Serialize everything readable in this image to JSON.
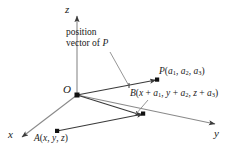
{
  "figure": {
    "type": "3d-coordinate-vector-diagram",
    "background_color": "#ffffff",
    "line_color": "#3a3a3a",
    "text_color": "#1a1a1a"
  },
  "axes": {
    "x_label": "x",
    "y_label": "y",
    "z_label": "z"
  },
  "origin": {
    "label": "O"
  },
  "annotation": {
    "line1": "position",
    "line2_prefix": "vector of ",
    "line2_italic": "P"
  },
  "points": {
    "P": {
      "name": "P",
      "coord_open": "(",
      "c1": "a",
      "c1_sub": "1",
      "sep1": ", ",
      "c2": "a",
      "c2_sub": "2",
      "sep2": ", ",
      "c3": "a",
      "c3_sub": "3",
      "coord_close": ")"
    },
    "B": {
      "name": "B",
      "coord_open": "(",
      "t1a": "x",
      "t1op": " + ",
      "t1b": "a",
      "t1b_sub": "1",
      "sep1": ", ",
      "t2a": "y",
      "t2op": " + ",
      "t2b": "a",
      "t2b_sub": "2",
      "sep2": ", ",
      "t3a": "z",
      "t3op": " + ",
      "t3b": "a",
      "t3b_sub": "3",
      "coord_close": ")"
    },
    "A": {
      "name": "A",
      "coord_open": "(",
      "c1": "x",
      "sep1": ", ",
      "c2": "y",
      "sep2": ", ",
      "c3": "z",
      "coord_close": ")"
    }
  }
}
